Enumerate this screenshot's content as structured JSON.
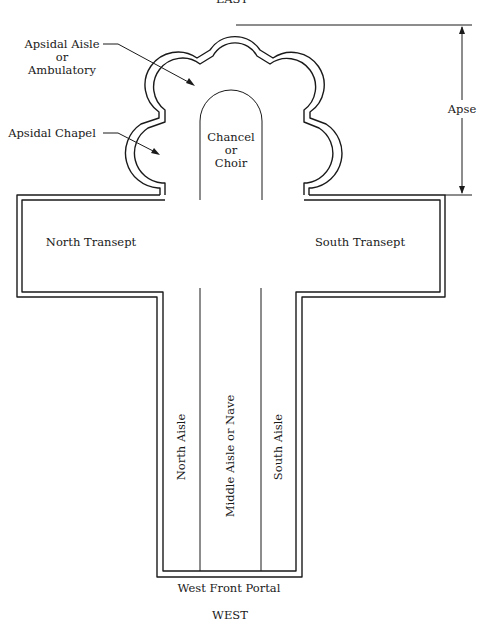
{
  "diagram": {
    "orientation": {
      "top": "EAST",
      "bottom": "WEST"
    },
    "labels": {
      "east": "EAST",
      "west": "WEST",
      "apsidal_aisle_line1": "Apsidal Aisle",
      "apsidal_aisle_line2": "or",
      "apsidal_aisle_line3": "Ambulatory",
      "apsidal_chapel": "Apsidal Chapel",
      "chancel_line1": "Chancel",
      "chancel_line2": "or",
      "chancel_line3": "Choir",
      "apse": "Apse",
      "north_transept": "North Transept",
      "south_transept": "South Transept",
      "north_aisle": "North Aisle",
      "middle_aisle": "Middle Aisle or Nave",
      "south_aisle": "South Aisle",
      "west_front_portal": "West Front Portal"
    },
    "colors": {
      "line": "#1a1a1a",
      "background": "#ffffff"
    }
  }
}
